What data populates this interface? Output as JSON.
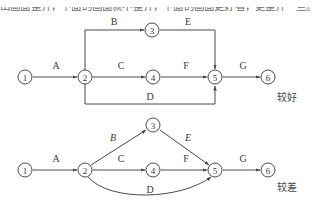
{
  "page": {
    "top_clipped_text": "出画面整齐，下面的画面就不整齐，下面的画面更好看，更整齐一些。",
    "background_color": "#ffffff",
    "stroke_color": "#4a4a4a",
    "text_color": "#3a3a3a"
  },
  "annotations": {
    "good_label": "较好",
    "bad_label": "较差"
  },
  "diagrams": [
    {
      "id": "top",
      "quality_note": "较好",
      "layout": "orthogonal",
      "nodes": [
        {
          "id": "1",
          "label": "1",
          "cx": 25,
          "cy": 77,
          "r": 7
        },
        {
          "id": "2",
          "label": "2",
          "cx": 85,
          "cy": 77,
          "r": 7
        },
        {
          "id": "3",
          "label": "3",
          "cx": 152,
          "cy": 30,
          "r": 7
        },
        {
          "id": "4",
          "label": "4",
          "cx": 153,
          "cy": 77,
          "r": 7
        },
        {
          "id": "5",
          "label": "5",
          "cx": 215,
          "cy": 77,
          "r": 7
        },
        {
          "id": "6",
          "label": "6",
          "cx": 268,
          "cy": 77,
          "r": 7
        }
      ],
      "edges": [
        {
          "id": "A",
          "label": "A",
          "from": "1",
          "to": "2",
          "label_x": 56,
          "label_y": 65,
          "path": "M 33 77 L 77 77"
        },
        {
          "id": "B",
          "label": "B",
          "from": "2",
          "to": "3",
          "label_x": 114,
          "label_y": 21,
          "path": "M 85 70 L 85 30 L 144 30"
        },
        {
          "id": "E",
          "label": "E",
          "from": "3",
          "to": "5",
          "label_x": 188,
          "label_y": 21,
          "path": "M 160 30 L 215 30 L 215 69"
        },
        {
          "id": "C",
          "label": "C",
          "from": "2",
          "to": "4",
          "label_x": 121,
          "label_y": 65,
          "path": "M 93 77 L 145 77"
        },
        {
          "id": "F",
          "label": "F",
          "from": "4",
          "to": "5",
          "label_x": 186,
          "label_y": 65,
          "path": "M 161 77 L 207 77"
        },
        {
          "id": "G",
          "label": "G",
          "from": "5",
          "to": "6",
          "label_x": 243,
          "label_y": 65,
          "path": "M 223 77 L 260 77"
        },
        {
          "id": "D",
          "label": "D",
          "from": "2",
          "to": "5",
          "label_x": 150,
          "label_y": 96,
          "path": "M 85 84 L 85 104 L 215 104 L 215 86"
        }
      ]
    },
    {
      "id": "bottom",
      "quality_note": "较差",
      "layout": "diagonal-curved",
      "nodes": [
        {
          "id": "1",
          "label": "1",
          "cx": 25,
          "cy": 170,
          "r": 7
        },
        {
          "id": "2",
          "label": "2",
          "cx": 85,
          "cy": 170,
          "r": 7
        },
        {
          "id": "3",
          "label": "3",
          "cx": 153,
          "cy": 125,
          "r": 7
        },
        {
          "id": "4",
          "label": "4",
          "cx": 153,
          "cy": 170,
          "r": 7
        },
        {
          "id": "5",
          "label": "5",
          "cx": 215,
          "cy": 170,
          "r": 7
        },
        {
          "id": "6",
          "label": "6",
          "cx": 268,
          "cy": 170,
          "r": 7
        }
      ],
      "edges": [
        {
          "id": "A",
          "label": "A",
          "from": "1",
          "to": "2",
          "slanted": false,
          "label_x": 56,
          "label_y": 158,
          "path": "M 33 170 L 77 170"
        },
        {
          "id": "B",
          "label": "B",
          "from": "2",
          "to": "3",
          "slanted": true,
          "label_x": 113,
          "label_y": 137,
          "path": "M 91 165 L 146 130"
        },
        {
          "id": "E",
          "label": "E",
          "from": "3",
          "to": "5",
          "slanted": true,
          "label_x": 188,
          "label_y": 137,
          "path": "M 160 130 L 209 165"
        },
        {
          "id": "C",
          "label": "C",
          "from": "2",
          "to": "4",
          "slanted": false,
          "label_x": 121,
          "label_y": 158,
          "path": "M 93 170 L 145 170"
        },
        {
          "id": "F",
          "label": "F",
          "from": "4",
          "to": "5",
          "slanted": false,
          "label_x": 186,
          "label_y": 158,
          "path": "M 161 170 L 207 170"
        },
        {
          "id": "G",
          "label": "G",
          "from": "5",
          "to": "6",
          "slanted": false,
          "label_x": 243,
          "label_y": 158,
          "path": "M 223 170 L 260 170"
        },
        {
          "id": "D",
          "label": "D",
          "from": "2",
          "to": "5",
          "slanted": false,
          "label_x": 150,
          "label_y": 189,
          "path": "M 88 177 C 110 202 180 200 211 177"
        }
      ]
    }
  ]
}
